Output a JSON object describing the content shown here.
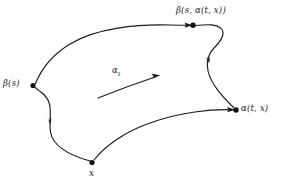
{
  "figure": {
    "type": "mathematical-diagram",
    "background_color": "#fefefe",
    "stroke_color": "#1a1a1a",
    "nodes": [
      {
        "id": "beta-s",
        "label": "β(s)",
        "x": 33,
        "y": 85,
        "label_x": 3,
        "label_y": 79
      },
      {
        "id": "beta-s-alpha-t-x",
        "label": "β(s, α(t, x))",
        "x": 193,
        "y": 25,
        "label_x": 176,
        "label_y": 6
      },
      {
        "id": "alpha-t-x",
        "label": "α(t, x)",
        "x": 236,
        "y": 110,
        "label_x": 241,
        "label_y": 104
      },
      {
        "id": "x",
        "label": "x",
        "x": 92,
        "y": 163,
        "label_x": 89,
        "label_y": 169
      }
    ],
    "flow_arrow": {
      "label": "α",
      "subscript": "t",
      "label_x": 112,
      "label_y": 66,
      "start_x": 98,
      "start_y": 98,
      "end_x": 160,
      "end_y": 76
    },
    "edges": [
      {
        "id": "top-edge",
        "from": "beta-s",
        "to": "beta-s-alpha-t-x",
        "has_arrowhead": false
      },
      {
        "id": "right-edge",
        "from": "beta-s-alpha-t-x",
        "to": "alpha-t-x",
        "has_arrowhead": true,
        "arrow_direction": "down"
      },
      {
        "id": "bottom-edge",
        "from": "x",
        "to": "alpha-t-x",
        "has_arrowhead": true,
        "arrow_direction": "right"
      },
      {
        "id": "left-edge",
        "from": "beta-s",
        "to": "x",
        "has_arrowhead": true,
        "arrow_direction": "down"
      }
    ]
  }
}
